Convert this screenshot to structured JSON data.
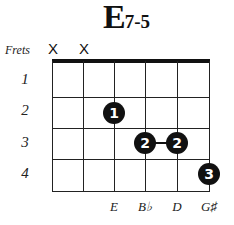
{
  "chord": {
    "root": "E",
    "quality": "7-5"
  },
  "frets_label": "Frets",
  "muted_strings": [
    {
      "string": 6,
      "symbol": "X"
    },
    {
      "string": 5,
      "symbol": "X"
    }
  ],
  "fret_numbers": [
    "1",
    "2",
    "3",
    "4"
  ],
  "fingers": [
    {
      "string": 4,
      "fret": 2,
      "finger": "1"
    },
    {
      "string": 3,
      "fret": 3,
      "finger": "2"
    },
    {
      "string": 2,
      "fret": 3,
      "finger": "2"
    },
    {
      "string": 1,
      "fret": 4,
      "finger": "3"
    }
  ],
  "barre": {
    "from_string": 3,
    "to_string": 2,
    "fret": 3
  },
  "notes": [
    "E",
    "B♭",
    "D",
    "G♯"
  ],
  "colors": {
    "ink": "#111111",
    "background": "#ffffff"
  }
}
